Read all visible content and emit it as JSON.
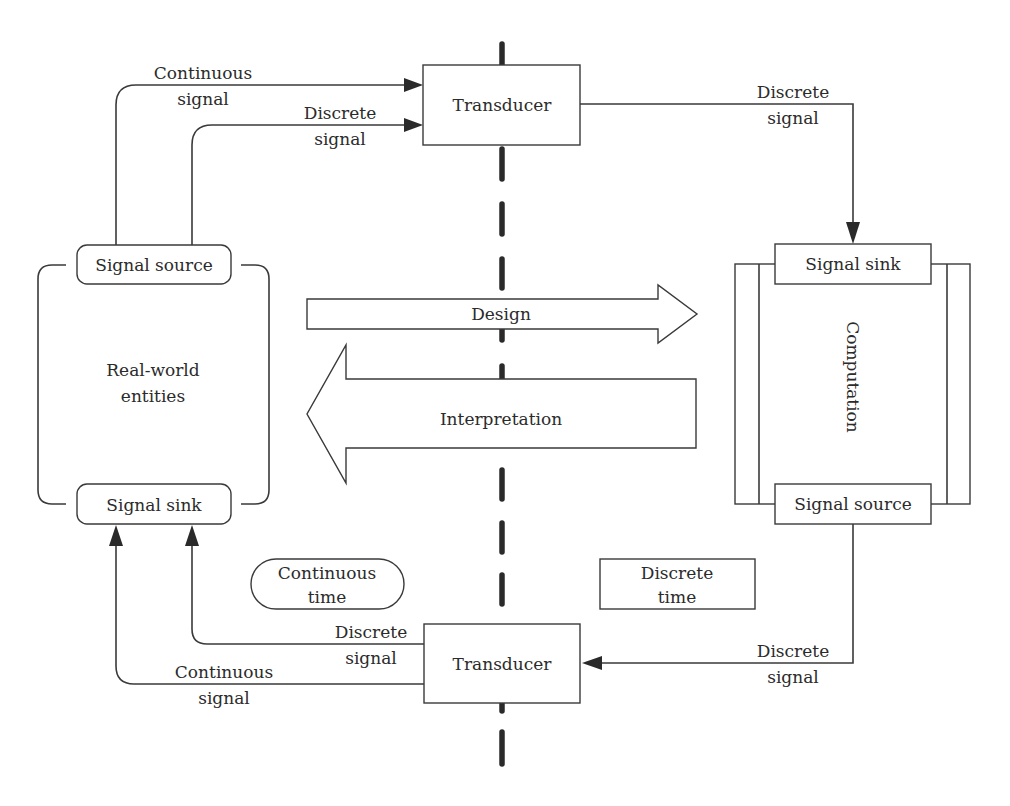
{
  "diagram": {
    "divider_label": "",
    "left_side": {
      "entity_label_line1": "Real-world",
      "entity_label_line2": "entities",
      "signal_source": "Signal source",
      "signal_sink": "Signal sink"
    },
    "right_side": {
      "computation_label": "Computation",
      "signal_sink": "Signal sink",
      "signal_source": "Signal source"
    },
    "top_transducer": {
      "label": "Transducer"
    },
    "bottom_transducer": {
      "label": "Transducer"
    },
    "top_flows": {
      "continuous_in": {
        "line1": "Continuous",
        "line2": "signal"
      },
      "discrete_in": {
        "line1": "Discrete",
        "line2": "signal"
      },
      "discrete_out": {
        "line1": "Discrete",
        "line2": "signal"
      }
    },
    "bottom_flows": {
      "discrete_in": {
        "line1": "Discrete",
        "line2": "signal"
      },
      "discrete_out": {
        "line1": "Discrete",
        "line2": "signal"
      },
      "continuous_out": {
        "line1": "Continuous",
        "line2": "signal"
      }
    },
    "arrows": {
      "design": "Design",
      "interpretation": "Interpretation"
    },
    "time_labels": {
      "continuous": {
        "line1": "Continuous",
        "line2": "time"
      },
      "discrete": {
        "line1": "Discrete",
        "line2": "time"
      }
    },
    "colors": {
      "stroke": "#3a3a3a",
      "background": "#ffffff",
      "text": "#2b2b2b"
    }
  }
}
